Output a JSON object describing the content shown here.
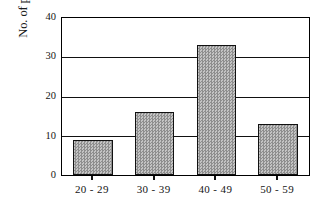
{
  "chart_data": {
    "type": "bar",
    "title": "",
    "xlabel": "",
    "ylabel": "No. of participants",
    "categories": [
      "20 - 29",
      "30 - 39",
      "40 - 49",
      "50 - 59"
    ],
    "values": [
      9,
      16,
      33,
      13
    ],
    "series": [
      {
        "name": "No. of participants",
        "values": [
          9,
          16,
          33,
          13
        ]
      }
    ],
    "ylim": [
      0,
      40
    ],
    "yticks": [
      0,
      10,
      20,
      30,
      40
    ],
    "ytick_labels": [
      "0",
      "10",
      "20",
      "30",
      "40"
    ],
    "grid": true,
    "grid_axis": "y",
    "legend": false,
    "legend_position": "none",
    "bar_fill_color": "#a8a8a8",
    "bar_edge_color": "#111111",
    "axis_color": "#000000",
    "background_color": "#ffffff"
  }
}
